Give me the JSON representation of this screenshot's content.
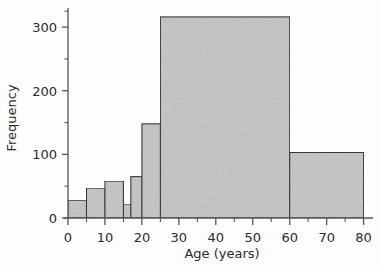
{
  "chart_data": {
    "type": "bar",
    "subtype": "histogram",
    "title": "",
    "xlabel": "Age (years)",
    "ylabel": "Frequency",
    "xlim": [
      0,
      82
    ],
    "ylim": [
      0,
      330
    ],
    "grid": false,
    "legend": null,
    "x_ticks_major": [
      0,
      10,
      20,
      30,
      40,
      50,
      60,
      70,
      80
    ],
    "x_tick_labels": [
      "0",
      "10",
      "20",
      "30",
      "40",
      "50",
      "60",
      "70",
      "80"
    ],
    "x_ticks_minor": [
      5,
      15,
      25,
      35,
      45,
      55,
      65,
      75
    ],
    "y_ticks_major": [
      0,
      100,
      200,
      300
    ],
    "y_tick_labels": [
      "0",
      "100",
      "200",
      "300"
    ],
    "y_ticks_minor": [
      50,
      150,
      250,
      325
    ],
    "bar_fill": "#cccccc",
    "bar_edge": "#3a3a3a",
    "axis_color": "#555555",
    "bins": [
      {
        "label": "0-5",
        "x0": 0,
        "x1": 5,
        "value": 28
      },
      {
        "label": "5-10",
        "x0": 5,
        "x1": 10,
        "value": 47
      },
      {
        "label": "10-15",
        "x0": 10,
        "x1": 15,
        "value": 58
      },
      {
        "label": "15-17",
        "x0": 15,
        "x1": 17,
        "value": 22
      },
      {
        "label": "17-20",
        "x0": 17,
        "x1": 20,
        "value": 65
      },
      {
        "label": "20-25",
        "x0": 20,
        "x1": 25,
        "value": 148
      },
      {
        "label": "25-60",
        "x0": 25,
        "x1": 60,
        "value": 316
      },
      {
        "label": "60-80",
        "x0": 60,
        "x1": 80,
        "value": 103
      }
    ]
  }
}
